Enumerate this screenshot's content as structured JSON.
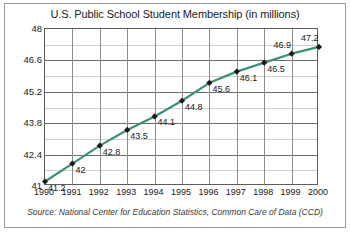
{
  "chart_data": {
    "type": "line",
    "title": "U.S. Public School Student Membership (in millions)",
    "xlabel": "",
    "ylabel": "",
    "categories": [
      "1990",
      "1991",
      "1992",
      "1993",
      "1994",
      "1995",
      "1996",
      "1997",
      "1998",
      "1999",
      "2000"
    ],
    "values": [
      41.2,
      42,
      42.8,
      43.5,
      44.1,
      44.8,
      45.6,
      46.1,
      46.5,
      46.9,
      47.2
    ],
    "point_labels": [
      "41.2",
      "42",
      "42.8",
      "43.5",
      "44.1",
      "44.8",
      "45.6",
      "46.1",
      "46.5",
      "46.9",
      "47.2"
    ],
    "ylim": [
      41,
      48
    ],
    "ytick_labels": [
      "41",
      "42.4",
      "43.8",
      "45.2",
      "46.6",
      "48"
    ],
    "ytick_values": [
      41,
      42.4,
      43.8,
      45.2,
      46.6,
      48
    ],
    "yminor_step": 0.7,
    "grid": true,
    "legend": "none",
    "series_color": "#3d8f7a",
    "marker_color": "#1a1a1a",
    "marker": "diamond",
    "source": "Source: National Center for Education Statistics, Common Care of Data (CCD)"
  }
}
